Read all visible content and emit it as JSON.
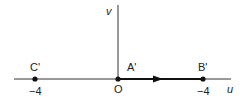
{
  "diagram": {
    "axes": {
      "horizontal_label": "u",
      "vertical_label": "v",
      "origin_label": "O"
    },
    "points": [
      {
        "name": "C'",
        "tick": "−4"
      },
      {
        "name": "A'"
      },
      {
        "name": "B'",
        "tick": "−4"
      }
    ],
    "colors": {
      "line": "#222222"
    }
  }
}
